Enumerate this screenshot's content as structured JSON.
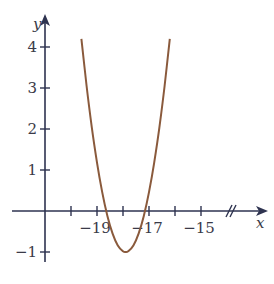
{
  "chart_data": {
    "type": "line",
    "title": "",
    "xlabel": "x",
    "ylabel": "y",
    "xlim": [
      -21,
      -14
    ],
    "ylim": [
      -1.5,
      4.5
    ],
    "x_ticks": [
      -20,
      -19,
      -18,
      -17,
      -16,
      -15
    ],
    "x_tick_labels": [
      "",
      "−19",
      "",
      "−17",
      "",
      "−15"
    ],
    "y_ticks": [
      -1,
      1,
      2,
      3,
      4
    ],
    "y_tick_labels": [
      "−1",
      "1",
      "2",
      "3",
      "4"
    ],
    "axis_break": "x-axis (//) between -15 and arrow",
    "grid": false,
    "series": [
      {
        "name": "parabola",
        "color": "#8a5a3c",
        "x": [
          -19.6,
          -19.4,
          -19.2,
          -19.0,
          -18.8,
          -18.6,
          -18.4,
          -18.2,
          -18.0,
          -17.9,
          -17.8,
          -17.6,
          -17.4,
          -17.2,
          -17.0,
          -16.8,
          -16.6,
          -16.4,
          -16.2
        ],
        "y": [
          4.2,
          3.05,
          2.04,
          1.18,
          0.46,
          -0.12,
          -0.55,
          -0.84,
          -0.98,
          -1.0,
          -0.98,
          -0.84,
          -0.55,
          -0.12,
          0.46,
          1.18,
          2.04,
          3.05,
          4.2
        ]
      }
    ]
  }
}
